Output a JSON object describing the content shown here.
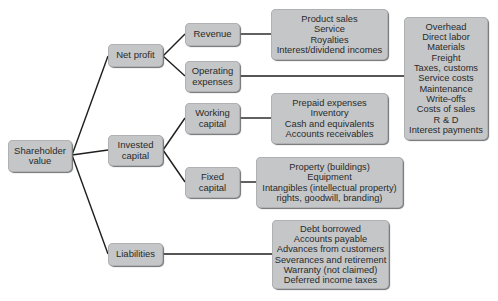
{
  "diagram": {
    "root": {
      "label_line1": "Shareholder",
      "label_line2": "value"
    },
    "level1": {
      "net_profit": {
        "label": "Net profit"
      },
      "invested_capital": {
        "label_line1": "Invested",
        "label_line2": "capital"
      },
      "liabilities": {
        "label": "Liabilities"
      }
    },
    "level2": {
      "revenue": {
        "label": "Revenue"
      },
      "operating_expenses": {
        "label_line1": "Operating",
        "label_line2": "expenses"
      },
      "working_capital": {
        "label_line1": "Working",
        "label_line2": "capital"
      },
      "fixed_capital": {
        "label_line1": "Fixed",
        "label_line2": "capital"
      }
    },
    "details": {
      "revenue_items": [
        "Product sales",
        "Service",
        "Royalties",
        "Interest/dividend incomes"
      ],
      "operating_expense_items": [
        "Overhead",
        "Direct labor",
        "Materials",
        "Freight",
        "Taxes, customs",
        "Service costs",
        "Maintenance",
        "Write-offs",
        "Costs of sales",
        "R & D",
        "Interest payments"
      ],
      "working_capital_items": [
        "Prepaid expenses",
        "Inventory",
        "Cash and equivalents",
        "Accounts receivables"
      ],
      "fixed_capital_items": [
        "Property (buildings)",
        "Equipment",
        "Intangibles (intellectual property)",
        "rights, goodwill, branding)"
      ],
      "liabilities_items": [
        "Debt borrowed",
        "Accounts payable",
        "Advances from customers",
        "Severances and retirement",
        "Warranty (not claimed)",
        "Deferred income taxes"
      ]
    }
  },
  "colors": {
    "box_fill": "#c4c6c8",
    "line": "#1e1e1e",
    "text": "#2a2a2a"
  }
}
